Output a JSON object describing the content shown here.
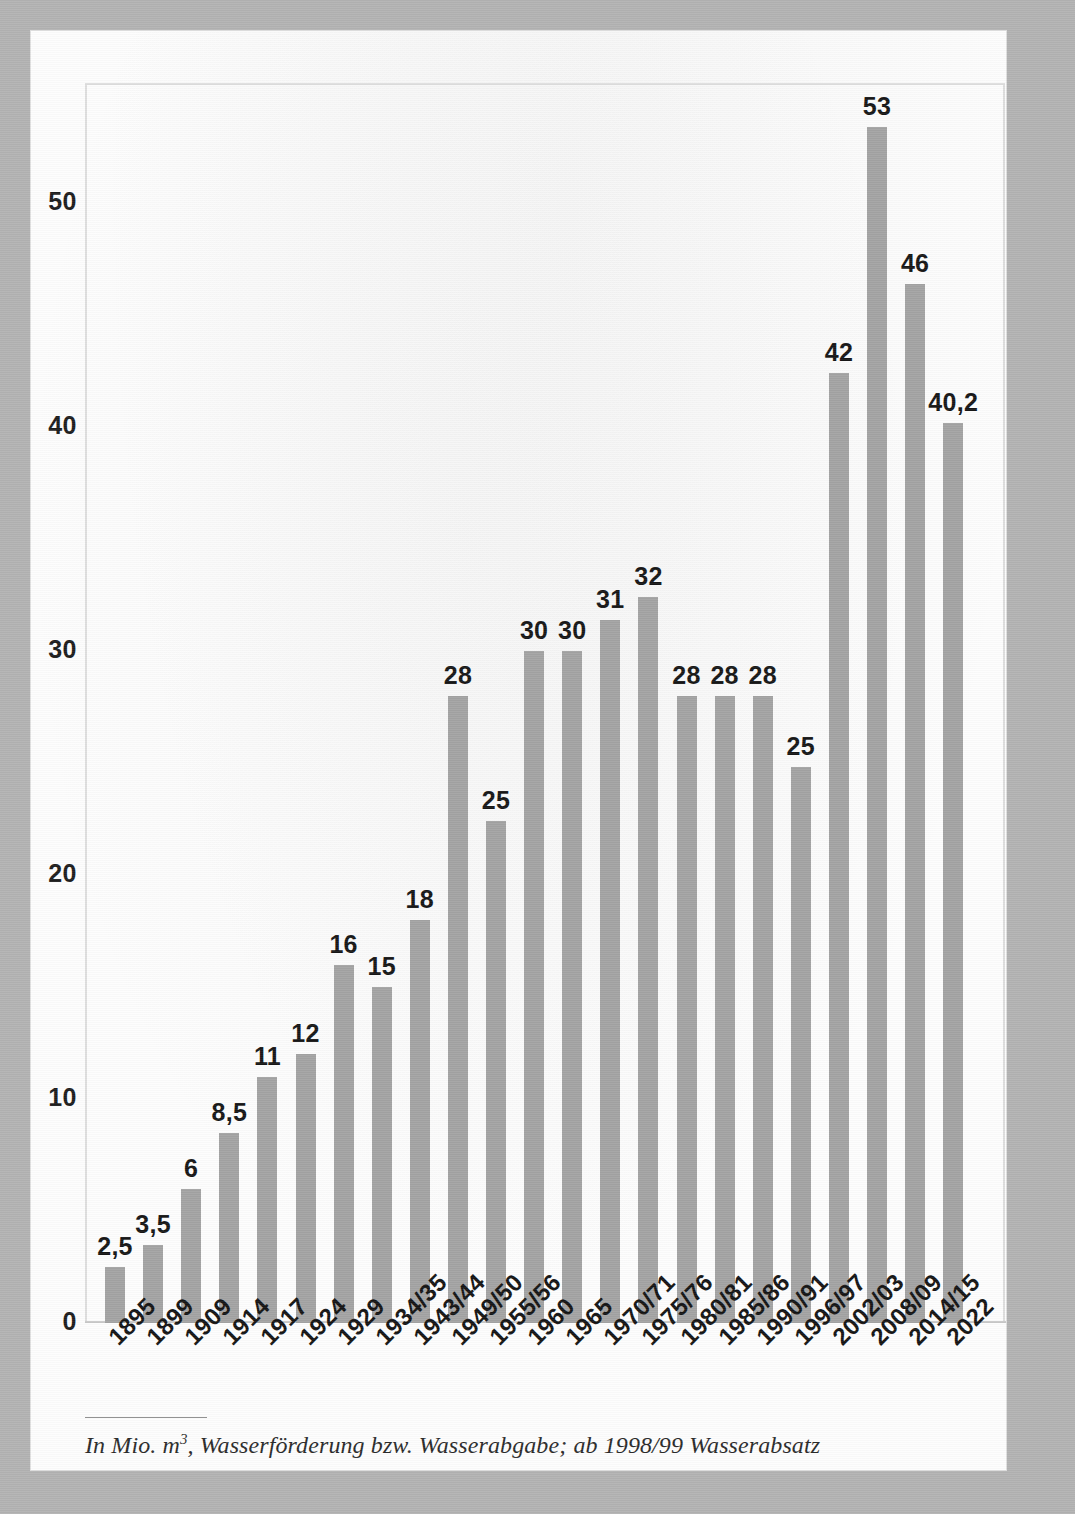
{
  "chart_data": {
    "type": "bar",
    "title": "",
    "subtitle": "",
    "xlabel": "",
    "ylabel": "",
    "ylim": [
      0,
      55
    ],
    "yticks": [
      0,
      10,
      20,
      30,
      40,
      50
    ],
    "ytick_labels": [
      "0",
      "10",
      "20",
      "30",
      "40",
      "50"
    ],
    "grid": false,
    "legend": "none",
    "bar_color": "#a3a3a3",
    "categories": [
      "1895",
      "1899",
      "1909",
      "1914",
      "1917",
      "1924",
      "1929",
      "1934/35",
      "1943/44",
      "1949/50",
      "1955/56",
      "1960",
      "1965",
      "1970/71",
      "1975/76",
      "1980/81",
      "1985/86",
      "1990/91",
      "1996/97",
      "2002/03",
      "2008/09",
      "2014/15",
      "2022"
    ],
    "values": [
      2.5,
      3.5,
      6,
      8.5,
      11,
      12,
      16,
      15,
      18,
      28,
      22.4,
      30,
      30,
      31.4,
      32.4,
      28,
      28,
      28,
      24.8,
      42.4,
      53.4,
      46.4,
      40.2
    ],
    "data_labels": [
      "2,5",
      "3,5",
      "6",
      "8,5",
      "11",
      "12",
      "16",
      "15",
      "18",
      "28",
      "25",
      "30",
      "30",
      "31",
      "32",
      "28",
      "28",
      "28",
      "25",
      "42",
      "53",
      "46",
      "40,2"
    ]
  },
  "footnote": {
    "prefix": "In Mio. m",
    "superscript": "3",
    "suffix": ", Wasserförderung bzw. Wasserabgabe; ab 1998/99 Wasserabsatz"
  }
}
